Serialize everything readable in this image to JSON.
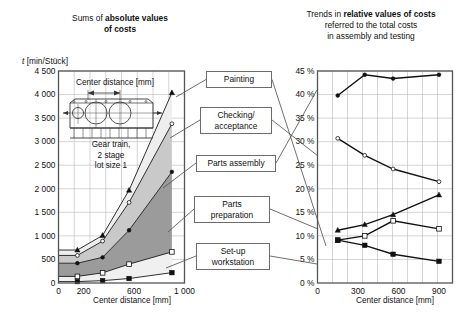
{
  "left_panel": {
    "title_plain_1": "Sums of ",
    "title_bold": "absolute values",
    "title_plain_2": "of costs",
    "y_axis_label_symbol": "t",
    "y_axis_label_unit": " [min/Stück]",
    "x_axis_label": "Center distance [mm]",
    "inset_caption": "Center distance [mm]",
    "inset_legend_line1": "Gear train,",
    "inset_legend_line2": "2 stage",
    "inset_legend_line3": "lot size 1",
    "y_ticks": [
      "4 500",
      "4 000",
      "3 500",
      "3 000",
      "2 500",
      "2 000",
      "1 500",
      "1 000",
      "500",
      "0"
    ],
    "x_ticks": [
      "0",
      "200",
      "600",
      "1 000"
    ]
  },
  "right_panel": {
    "title_plain_1": "Trends in ",
    "title_bold": "relative values of costs",
    "title_line2": "referred to the total costs",
    "title_line3": "in assembly and testing",
    "x_axis_label": "Center distance [mm]",
    "y_ticks": [
      "45 %",
      "40 %",
      "35 %",
      "30 %",
      "25 %",
      "20 %",
      "15 %",
      "10 %",
      "5 %",
      "0 %"
    ],
    "x_ticks": [
      "0",
      "300",
      "600",
      "900"
    ]
  },
  "callouts": [
    {
      "name": "painting",
      "label": "Painting"
    },
    {
      "name": "checking-acceptance",
      "label": "Checking/\nacceptance"
    },
    {
      "name": "parts-assembly",
      "label": "Parts assembly"
    },
    {
      "name": "parts-preparation",
      "label": "Parts\npreparation"
    },
    {
      "name": "setup-workstation",
      "label": "Set-up\nworkstation"
    }
  ],
  "chart_data": [
    {
      "id": "absolute-costs",
      "type": "area",
      "stacked": true,
      "title": "Sums of absolute values of costs",
      "xlabel": "Center distance [mm]",
      "ylabel": "t [min/Stück]",
      "xlim": [
        0,
        1000
      ],
      "ylim": [
        0,
        4500
      ],
      "xticks": [
        0,
        200,
        600,
        1000
      ],
      "yticks": [
        0,
        500,
        1000,
        1500,
        2000,
        2500,
        3000,
        3500,
        4000,
        4500
      ],
      "grid": true,
      "x": [
        150,
        350,
        560,
        900
      ],
      "series": [
        {
          "name": "Set-up workstation",
          "marker": "filled-square",
          "cumulative": [
            30,
            50,
            95,
            220
          ],
          "values": [
            30,
            50,
            95,
            220
          ],
          "fill": "#ffffff"
        },
        {
          "name": "Parts preparation",
          "marker": "open-square",
          "cumulative": [
            140,
            215,
            400,
            660
          ],
          "values": [
            110,
            165,
            305,
            440
          ],
          "fill": "#f0f0f0"
        },
        {
          "name": "Parts assembly",
          "marker": "filled-circle",
          "cumulative": [
            420,
            545,
            1120,
            2360
          ],
          "values": [
            280,
            330,
            720,
            1700
          ],
          "fill": "#9b9b9b"
        },
        {
          "name": "Checking/acceptance",
          "marker": "open-circle",
          "cumulative": [
            585,
            890,
            1710,
            3380
          ],
          "values": [
            165,
            345,
            590,
            1020
          ],
          "fill": "#c9c9c9"
        },
        {
          "name": "Painting",
          "marker": "filled-triangle",
          "cumulative": [
            700,
            1010,
            1970,
            4040
          ],
          "values": [
            115,
            120,
            260,
            660
          ],
          "fill": "#eeeeee"
        }
      ]
    },
    {
      "id": "relative-costs",
      "type": "line",
      "title": "Trends in relative values of costs referred to the total costs in assembly and testing",
      "xlabel": "Center distance [mm]",
      "ylabel": "%",
      "xlim": [
        0,
        1000
      ],
      "ylim": [
        0,
        45
      ],
      "xticks": [
        0,
        300,
        600,
        900
      ],
      "yticks": [
        0,
        5,
        10,
        15,
        20,
        25,
        30,
        35,
        40,
        45
      ],
      "grid": true,
      "x": [
        150,
        350,
        560,
        900
      ],
      "series": [
        {
          "name": "Parts assembly",
          "marker": "filled-circle",
          "values": [
            39.8,
            44.2,
            43.4,
            44.2
          ]
        },
        {
          "name": "Checking/acceptance",
          "marker": "open-circle",
          "values": [
            30.7,
            27.1,
            24.2,
            21.5
          ]
        },
        {
          "name": "Painting",
          "marker": "filled-triangle",
          "values": [
            11.2,
            12.4,
            14.5,
            18.7
          ]
        },
        {
          "name": "Parts preparation",
          "marker": "open-square",
          "values": [
            9.1,
            10.0,
            13.2,
            11.5
          ]
        },
        {
          "name": "Set-up workstation",
          "marker": "filled-square",
          "values": [
            9.1,
            8.0,
            6.1,
            4.6
          ]
        }
      ]
    }
  ]
}
